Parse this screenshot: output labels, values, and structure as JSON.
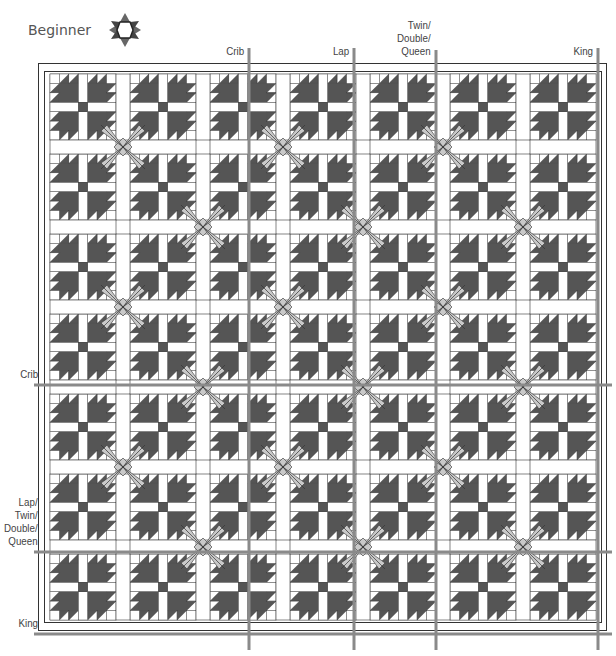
{
  "header": {
    "skill_level": "Beginner",
    "skill_icon": "star-icon"
  },
  "size_labels": {
    "top": [
      {
        "label": "Crib",
        "x": 249
      },
      {
        "label": "Lap",
        "x": 354
      },
      {
        "label": "Twin/\nDouble/\nQueen",
        "x": 436
      },
      {
        "label": "King",
        "x": 598
      }
    ],
    "left": [
      {
        "label": "Crib",
        "y": 385
      },
      {
        "label": "Lap/\nTwin/\nDouble/\nQueen",
        "y": 552
      },
      {
        "label": "King",
        "y": 634
      }
    ]
  },
  "quilt": {
    "pattern": "Bear Paw",
    "columns": 7,
    "rows": 7,
    "colors": {
      "dark": "#555555",
      "light": "#c9c9c9",
      "outline": "#333333",
      "guide": "#8a8a8a",
      "background": "#ffffff"
    }
  }
}
